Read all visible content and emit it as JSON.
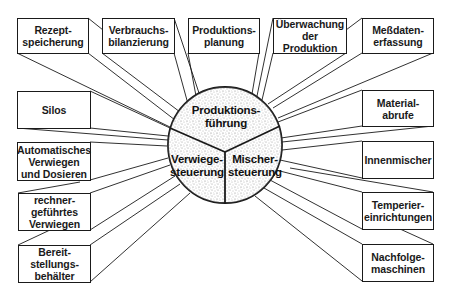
{
  "diagram": {
    "center": {
      "segments": [
        {
          "id": "top",
          "label": "Produktions-\nführung"
        },
        {
          "id": "left",
          "label": "Verwiege-\nsteuerung"
        },
        {
          "id": "right",
          "label": "Mischer-\nsteuerung"
        }
      ]
    },
    "top_boxes": [
      {
        "label": "Rezept-\nspeicherung"
      },
      {
        "label": "Verbrauchs-\nbilanzierung"
      },
      {
        "label": "Produktions-\nplanung"
      },
      {
        "label": "Überwachung\nder\nProduktion"
      },
      {
        "label": "Meßdaten-\nerfassung"
      }
    ],
    "left_boxes": [
      {
        "label": "Silos"
      },
      {
        "label": "Automatisches\nVerwiegen\nund Dosieren"
      },
      {
        "label": "rechner-\ngeführtes\nVerwiegen"
      },
      {
        "label": "Bereit-\nstellungs-\nbehälter"
      }
    ],
    "right_boxes": [
      {
        "label": "Material-\nabrufe"
      },
      {
        "label": "Innenmischer"
      },
      {
        "label": "Temperier-\neinrichtungen"
      },
      {
        "label": "Nachfolge-\nmaschinen"
      }
    ],
    "colors": {
      "line": "#1a1a1a",
      "background": "#ffffff",
      "stipple": "#8a8a8a"
    }
  }
}
